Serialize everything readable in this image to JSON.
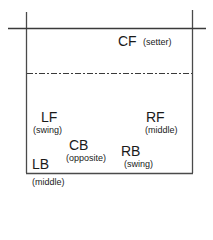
{
  "diagram": {
    "type": "volleyball-court-rotation",
    "players": [
      {
        "position": "CF",
        "role": "(setter)"
      },
      {
        "position": "LF",
        "role": "(swing)"
      },
      {
        "position": "RF",
        "role": "(middle)"
      },
      {
        "position": "CB",
        "role": "(opposite)"
      },
      {
        "position": "RB",
        "role": "(swing)"
      },
      {
        "position": "LB",
        "role": "(middle)"
      }
    ],
    "line_color": "#333333"
  }
}
